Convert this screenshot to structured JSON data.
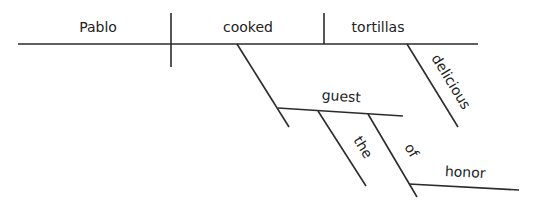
{
  "diagram": {
    "type": "sentence-diagram",
    "sentence": "Pablo cooked the delicious tortillas for the guest of honor",
    "words": {
      "subject": "Pablo",
      "verb": "cooked",
      "direct_object": "tortillas",
      "object_modifier": "delicious",
      "indirect_object": "guest",
      "indirect_object_article": "the",
      "preposition": "of",
      "prepositional_object": "honor"
    },
    "relations": [
      {
        "from": "Pablo",
        "to": "cooked",
        "role": "subject-verb"
      },
      {
        "from": "cooked",
        "to": "tortillas",
        "role": "verb-direct-object"
      },
      {
        "from": "tortillas",
        "to": "delicious",
        "role": "adjective-modifier"
      },
      {
        "from": "cooked",
        "to": "guest",
        "role": "indirect-object"
      },
      {
        "from": "guest",
        "to": "the",
        "role": "article-modifier"
      },
      {
        "from": "guest",
        "to": "of",
        "role": "prepositional-phrase"
      },
      {
        "from": "of",
        "to": "honor",
        "role": "object-of-preposition"
      }
    ],
    "colors": {
      "line": "#2b2b2b",
      "text": "#222222",
      "background": "#ffffff"
    }
  }
}
